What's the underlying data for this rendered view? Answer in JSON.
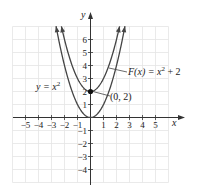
{
  "chart_data": {
    "type": "line",
    "title": "",
    "xlabel": "x",
    "ylabel": "y",
    "xlim": [
      -6,
      6
    ],
    "ylim": [
      -5,
      7
    ],
    "grid": true,
    "x_ticks": [
      -5,
      -4,
      -3,
      -2,
      -1,
      1,
      2,
      3,
      4,
      5
    ],
    "x_tick_labels": [
      "−5",
      "−4",
      "−3",
      "−2",
      "−1",
      "1",
      "2",
      "3",
      "4",
      "5"
    ],
    "y_ticks": [
      -4,
      -3,
      -2,
      -1,
      1,
      2,
      3,
      4,
      5,
      6
    ],
    "y_tick_labels": [
      "−4",
      "−3",
      "−2",
      "−1",
      "1",
      "2",
      "3",
      "4",
      "5",
      "6"
    ],
    "series": [
      {
        "name": "y = x²",
        "formula": "x^2",
        "x_range": [
          -2.65,
          2.65
        ]
      },
      {
        "name": "F(x) = x² + 2",
        "formula": "x^2 + 2",
        "x_range": [
          -2.24,
          2.24
        ]
      }
    ],
    "annotations": [
      {
        "text": "y = x²",
        "target_series": 0
      },
      {
        "text": "F(x) = x² + 2",
        "target_series": 1
      },
      {
        "text": "(0, 2)",
        "point": [
          0,
          2
        ]
      }
    ]
  },
  "labels": {
    "x_axis": "x",
    "y_axis": "y",
    "base_curve": "y = x",
    "base_curve_exp": "2",
    "shift_curve_prefix": "F(x) = x",
    "shift_curve_exp": "2",
    "shift_curve_suffix": " + 2",
    "point": "(0, 2)"
  },
  "colors": {
    "grid": "#e4e4e4",
    "axis": "#333333",
    "curve": "#444444",
    "point": "#111111"
  }
}
